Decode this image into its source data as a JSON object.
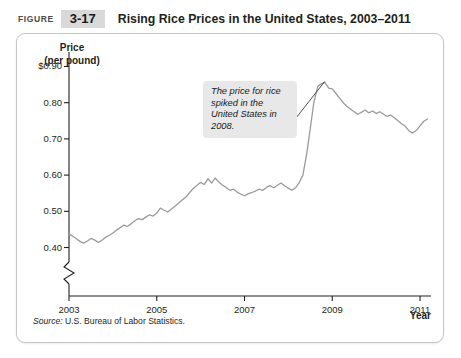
{
  "header": {
    "figure_word": "Figure",
    "figure_number": "3-17",
    "title": "Rising Rice Prices in the United States, 2003–2011"
  },
  "annotation": {
    "text": "The price for rice spiked in the United States in 2008."
  },
  "source": {
    "label": "Source:",
    "text": "U.S. Bureau of Labor Statistics."
  },
  "colors": {
    "line": "#9a9a9a",
    "axis": "#231f20",
    "annotation_background": "#e8e8e8",
    "figure_number_background": "#d9d9d9",
    "panel_border": "#c6c6c6"
  },
  "chart_data": {
    "type": "line",
    "title": "Rising Rice Prices in the United States, 2003–2011",
    "xlabel": "Year",
    "ylabel": "Price (per pound)",
    "ylabel_line1": "Price",
    "ylabel_line2": "(per pound)",
    "xlim": [
      2003,
      2011.25
    ],
    "ylim": [
      0.36,
      0.94
    ],
    "yticks": [
      0.4,
      0.5,
      0.6,
      0.7,
      0.8,
      0.9
    ],
    "ytick_labels": [
      "0.40",
      "0.50",
      "0.60",
      "0.70",
      "0.80",
      "$0.90"
    ],
    "xticks": [
      2003,
      2005,
      2007,
      2009,
      2011
    ],
    "xtick_labels": [
      "2003",
      "2005",
      "2007",
      "2009",
      "2011"
    ],
    "grid": false,
    "legend": false,
    "axis_break_y": true,
    "series": [
      {
        "name": "Rice price per pound",
        "x": [
          2003.0,
          2003.08,
          2003.17,
          2003.25,
          2003.33,
          2003.42,
          2003.5,
          2003.58,
          2003.67,
          2003.75,
          2003.83,
          2003.92,
          2004.0,
          2004.08,
          2004.17,
          2004.25,
          2004.33,
          2004.42,
          2004.5,
          2004.58,
          2004.67,
          2004.75,
          2004.83,
          2004.92,
          2005.0,
          2005.08,
          2005.17,
          2005.25,
          2005.33,
          2005.42,
          2005.5,
          2005.58,
          2005.67,
          2005.75,
          2005.83,
          2005.92,
          2006.0,
          2006.08,
          2006.17,
          2006.25,
          2006.33,
          2006.42,
          2006.5,
          2006.58,
          2006.67,
          2006.75,
          2006.83,
          2006.92,
          2007.0,
          2007.08,
          2007.17,
          2007.25,
          2007.33,
          2007.42,
          2007.5,
          2007.58,
          2007.67,
          2007.75,
          2007.83,
          2007.92,
          2008.0,
          2008.08,
          2008.17,
          2008.25,
          2008.33,
          2008.42,
          2008.5,
          2008.58,
          2008.67,
          2008.75,
          2008.83,
          2008.92,
          2009.0,
          2009.08,
          2009.17,
          2009.25,
          2009.33,
          2009.42,
          2009.5,
          2009.58,
          2009.67,
          2009.75,
          2009.83,
          2009.92,
          2010.0,
          2010.08,
          2010.17,
          2010.25,
          2010.33,
          2010.42,
          2010.5,
          2010.58,
          2010.67,
          2010.75,
          2010.83,
          2010.92,
          2011.0,
          2011.08,
          2011.17
        ],
        "y": [
          0.437,
          0.432,
          0.424,
          0.417,
          0.412,
          0.418,
          0.425,
          0.421,
          0.414,
          0.42,
          0.428,
          0.434,
          0.44,
          0.448,
          0.455,
          0.462,
          0.458,
          0.466,
          0.474,
          0.48,
          0.477,
          0.484,
          0.49,
          0.487,
          0.495,
          0.509,
          0.503,
          0.498,
          0.506,
          0.515,
          0.523,
          0.531,
          0.54,
          0.552,
          0.563,
          0.572,
          0.58,
          0.574,
          0.59,
          0.578,
          0.592,
          0.58,
          0.572,
          0.566,
          0.558,
          0.561,
          0.553,
          0.547,
          0.543,
          0.548,
          0.552,
          0.556,
          0.561,
          0.558,
          0.566,
          0.571,
          0.565,
          0.572,
          0.578,
          0.57,
          0.564,
          0.558,
          0.566,
          0.58,
          0.6,
          0.66,
          0.73,
          0.8,
          0.845,
          0.852,
          0.856,
          0.84,
          0.838,
          0.826,
          0.812,
          0.8,
          0.79,
          0.782,
          0.775,
          0.768,
          0.774,
          0.78,
          0.772,
          0.777,
          0.77,
          0.775,
          0.768,
          0.762,
          0.766,
          0.758,
          0.75,
          0.742,
          0.734,
          0.722,
          0.716,
          0.724,
          0.736,
          0.748,
          0.755
        ],
        "peak_value": 0.856,
        "peak_year": 2008.83,
        "start_value": 0.437,
        "end_value": 0.755,
        "min_value": 0.412
      }
    ]
  }
}
